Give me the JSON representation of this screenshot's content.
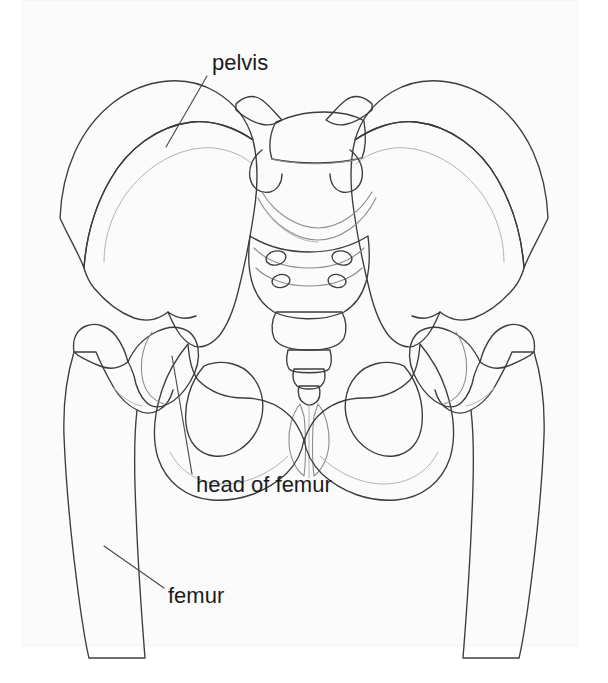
{
  "figure": {
    "type": "anatomical-line-diagram",
    "view": "anterior",
    "background_color": "#ffffff",
    "plate_color": "#fbfbfb",
    "outline_color": "#3c3c3c",
    "shading_color": "#d7d7d7",
    "label_color": "#1b1b1b",
    "label_font_size_px": 22
  },
  "labels": [
    {
      "id": "pelvis",
      "text": "pelvis",
      "x": 212,
      "y": 70,
      "anchor": "start",
      "leader": {
        "x1": 207,
        "y1": 76,
        "x2": 166,
        "y2": 147
      }
    },
    {
      "id": "head-of-femur",
      "text": "head of femur",
      "x": 196,
      "y": 492,
      "anchor": "start",
      "leader": {
        "x1": 192,
        "y1": 474,
        "x2": 172,
        "y2": 356
      }
    },
    {
      "id": "femur",
      "text": "femur",
      "x": 168,
      "y": 603,
      "anchor": "start",
      "leader": {
        "x1": 164,
        "y1": 588,
        "x2": 104,
        "y2": 546
      }
    }
  ],
  "structures": [
    {
      "id": "left-ilium",
      "name": "ilium (viewer left)"
    },
    {
      "id": "right-ilium",
      "name": "ilium (viewer right)"
    },
    {
      "id": "lumbar-vertebra",
      "name": "fifth lumbar vertebra"
    },
    {
      "id": "sacrum",
      "name": "sacrum"
    },
    {
      "id": "coccyx",
      "name": "coccyx"
    },
    {
      "id": "left-obturator-foramen",
      "name": "obturator foramen (viewer left)"
    },
    {
      "id": "right-obturator-foramen",
      "name": "obturator foramen (viewer right)"
    },
    {
      "id": "pubic-symphysis",
      "name": "pubic symphysis"
    },
    {
      "id": "left-femoral-head",
      "name": "head of femur (viewer left)"
    },
    {
      "id": "right-femoral-head",
      "name": "head of femur (viewer right)"
    },
    {
      "id": "left-greater-trochanter",
      "name": "greater trochanter (viewer left)"
    },
    {
      "id": "right-greater-trochanter",
      "name": "greater trochanter (viewer right)"
    },
    {
      "id": "left-femur-shaft",
      "name": "femoral shaft (viewer left)"
    },
    {
      "id": "right-femur-shaft",
      "name": "femoral shaft (viewer right)"
    }
  ]
}
